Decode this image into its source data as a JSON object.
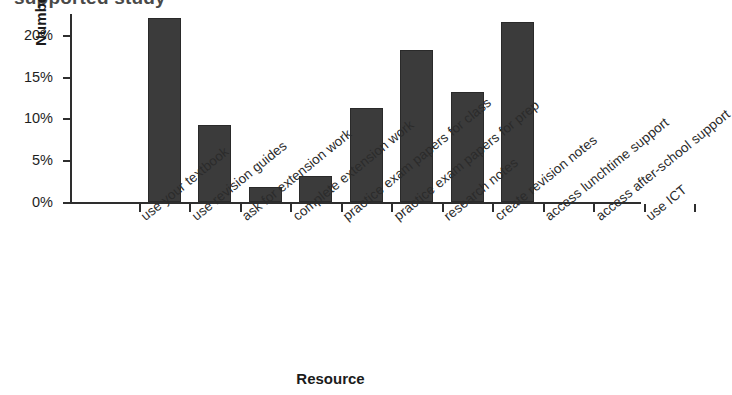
{
  "title_partial": "supported study",
  "axis": {
    "ylabel": "Number of students",
    "xlabel": "Resource",
    "yticks": [
      "0%",
      "5%",
      "10%",
      "15%",
      "20%"
    ]
  },
  "chart_data": {
    "type": "bar",
    "title": "supported study",
    "xlabel": "Resource",
    "ylabel": "Number of students",
    "ylim": [
      0,
      22.5
    ],
    "ytick_values": [
      0,
      5,
      10,
      15,
      20
    ],
    "ytick_labels": [
      "0%",
      "5%",
      "10%",
      "15%",
      "20%"
    ],
    "grid": false,
    "legend": "none",
    "bar_color": "#3b3b3b",
    "categories": [
      "use your textbook",
      "use revision guides",
      "ask for extension work",
      "complete extension work",
      "practice exam papers for class",
      "practice exam papers for prep",
      "research notes",
      "create revision notes",
      "access lunchtime support",
      "access after-school support",
      "use ICT"
    ],
    "values": [
      22.0,
      9.2,
      1.8,
      3.1,
      11.2,
      18.2,
      13.2,
      21.5,
      0,
      0,
      0
    ],
    "value_unit": "%"
  }
}
